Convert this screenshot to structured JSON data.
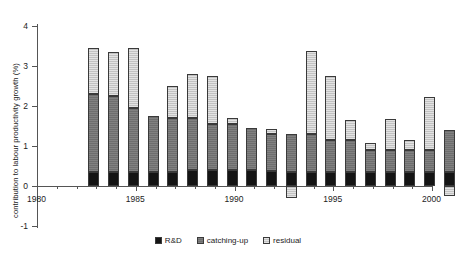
{
  "chart_data": {
    "type": "bar",
    "stacked": true,
    "title": "",
    "xlabel": "",
    "ylabel": "contribution to labour productivity growth (%)",
    "ylim": [
      -1,
      4
    ],
    "ytick_labels": [
      "4",
      "3",
      "2",
      "1",
      "0",
      "-1"
    ],
    "ytick_values": [
      4,
      3,
      2,
      1,
      0,
      -1
    ],
    "xlim": [
      1980,
      2000
    ],
    "xtick_labels": [
      "1980",
      "1985",
      "1990",
      "1995",
      "2000"
    ],
    "xtick_values": [
      1980,
      1985,
      1990,
      1995,
      2000
    ],
    "grid": false,
    "legend_position": "bottom",
    "categories": [
      1981,
      1982,
      1983,
      1984,
      1985,
      1986,
      1987,
      1988,
      1989,
      1990,
      1991,
      1992,
      1993,
      1994,
      1995,
      1996,
      1997,
      1998,
      1999
    ],
    "series": [
      {
        "name": "R&D",
        "color": "#151515",
        "values": [
          0.35,
          0.35,
          0.35,
          0.35,
          0.35,
          0.4,
          0.4,
          0.4,
          0.4,
          0.38,
          0.35,
          0.35,
          0.35,
          0.35,
          0.35,
          0.35,
          0.35,
          0.35,
          0.35
        ]
      },
      {
        "name": "catching-up",
        "color": "#6e6e6e",
        "values": [
          1.95,
          1.9,
          1.6,
          1.4,
          1.35,
          1.3,
          1.15,
          1.15,
          1.05,
          0.93,
          0.95,
          0.95,
          0.8,
          0.8,
          0.55,
          0.55,
          0.55,
          0.55,
          1.05
        ]
      },
      {
        "name": "residual",
        "color": "#c2c2c2",
        "values": [
          1.15,
          1.1,
          1.5,
          0.0,
          0.8,
          1.1,
          1.2,
          0.15,
          0.0,
          0.12,
          -0.3,
          2.08,
          1.6,
          0.5,
          0.18,
          0.78,
          0.25,
          1.33,
          -0.25
        ]
      }
    ],
    "totals": [
      3.45,
      3.35,
      3.45,
      1.75,
      2.5,
      2.8,
      2.75,
      1.7,
      1.45,
      1.43,
      1.3,
      3.38,
      2.75,
      1.65,
      1.08,
      1.68,
      1.15,
      2.23,
      1.15
    ],
    "annotations": [
      {
        "year": 1991,
        "note": "residual extends below zero axis"
      }
    ]
  },
  "legend": {
    "items": [
      {
        "label": "R&D",
        "swatch": "black-square-swatch"
      },
      {
        "label": "catching-up",
        "swatch": "dark-gray-square-swatch"
      },
      {
        "label": "residual",
        "swatch": "light-gray-square-swatch"
      }
    ]
  }
}
